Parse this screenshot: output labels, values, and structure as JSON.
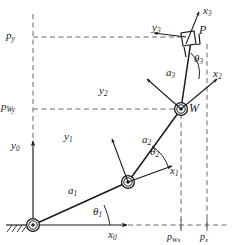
{
  "figure": {
    "kind": "planar-3r-manipulator-kinematics-diagram",
    "background": "#ffffff",
    "stroke_color": "#1a1a1a",
    "dash_color": "#55585c",
    "width": 232,
    "height": 245
  },
  "axes": {
    "origin_label": "y",
    "x0": {
      "name": "x0",
      "base": "x",
      "sub": "0",
      "x": 108,
      "y": 236
    },
    "y0": {
      "name": "y0",
      "base": "y",
      "sub": "0",
      "x": 12,
      "y": 148
    },
    "x1": {
      "name": "x1",
      "base": "x",
      "sub": "1",
      "x": 172,
      "y": 172
    },
    "y1": {
      "name": "y1",
      "base": "y",
      "sub": "1",
      "x": 66,
      "y": 137
    },
    "x2": {
      "name": "x2",
      "base": "x",
      "sub": "2",
      "x": 213,
      "y": 74
    },
    "y2": {
      "name": "y2",
      "base": "y",
      "sub": "2",
      "x": 101,
      "y": 90
    },
    "x3": {
      "name": "x3",
      "base": "x",
      "sub": "3",
      "x": 208,
      "y": 11
    },
    "y3": {
      "name": "y3",
      "base": "y",
      "sub": "3",
      "x": 155,
      "y": 28
    }
  },
  "links": [
    {
      "name": "a1",
      "base": "a",
      "sub": "1",
      "x": 70,
      "y": 190
    },
    {
      "name": "a2",
      "base": "a",
      "sub": "2",
      "x": 144,
      "y": 140
    },
    {
      "name": "a3",
      "base": "a",
      "sub": "3",
      "x": 169,
      "y": 73
    }
  ],
  "angles": [
    {
      "name": "theta1",
      "base": "θ",
      "sub": "1",
      "x": 95,
      "y": 213
    },
    {
      "name": "theta2",
      "base": "θ",
      "sub": "2",
      "x": 152,
      "y": 152
    },
    {
      "name": "theta3",
      "base": "θ",
      "sub": "3",
      "x": 196,
      "y": 59
    }
  ],
  "points": [
    {
      "name": "point-W",
      "label": "W",
      "x": 187,
      "y": 108
    },
    {
      "name": "point-P",
      "label": "P",
      "x": 200,
      "y": 31
    }
  ],
  "coordinate_labels": [
    {
      "name": "p-y",
      "base": "p",
      "sub": "y",
      "x": 7,
      "y": 30,
      "size": "s11"
    },
    {
      "name": "p-Wy",
      "base": "p",
      "sub": "Wy",
      "x": 2,
      "y": 101,
      "size": "s11"
    },
    {
      "name": "p-Wx",
      "base": "p",
      "sub": "Wx",
      "x": 165,
      "y": 230,
      "size": "s10"
    },
    {
      "name": "p-x",
      "base": "p",
      "sub": "x",
      "x": 199,
      "y": 230,
      "size": "s10"
    }
  ],
  "geometry": {
    "base_joint": {
      "x": 33,
      "y": 225
    },
    "elbow_joint": {
      "x": 128,
      "y": 182
    },
    "wrist_joint": {
      "x": 181,
      "y": 109
    },
    "end_point": {
      "x": 191,
      "y": 40
    },
    "y_axis_x": 33,
    "x_axis_y": 225,
    "p_wx_line_x": 181,
    "p_x_line_x": 207,
    "p_y_line_y": 37,
    "p_wy_line_y": 109
  }
}
